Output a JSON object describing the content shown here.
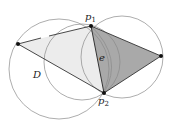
{
  "diagram": {
    "labels": {
      "p1_main": "p",
      "p1_sub": "1",
      "p2_main": "p",
      "p2_sub": "2",
      "edge": "e",
      "region": "D"
    },
    "colors": {
      "stroke": "#333333",
      "circle": "#8a8a8a",
      "light_fill": "#ececec",
      "dark_fill": "#a9a9a9",
      "point": "#111111"
    },
    "points": {
      "left": [
        18,
        44
      ],
      "p1": [
        91,
        26
      ],
      "p2": [
        104,
        93
      ],
      "right": [
        161,
        56
      ]
    }
  }
}
